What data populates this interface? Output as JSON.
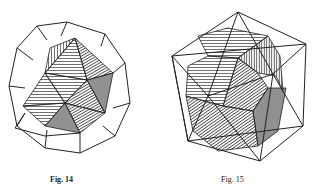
{
  "figures": [
    {
      "id": "fig14",
      "caption": "Fig. 14",
      "description": "Icosahedron inscribed in dodecahedron (wireframe outer, hatched inner)"
    },
    {
      "id": "fig15",
      "caption": "Fig. 15",
      "description": "Dodecahedron inscribed in icosahedron (wireframe outer, hatched inner)"
    }
  ],
  "colors": {
    "ink": "#222222",
    "paper": "#ffffff"
  }
}
